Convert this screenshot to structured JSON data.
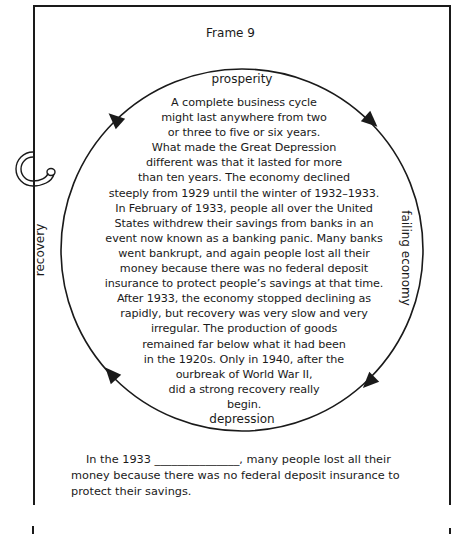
{
  "frame": {
    "title": "Frame 9"
  },
  "cycle": {
    "labels": {
      "top": "prosperity",
      "right": "failing economy",
      "bottom": "depression",
      "left": "recovery"
    },
    "arrow_direction": "clockwise",
    "passage_lines": [
      "A complete business cycle",
      "might last anywhere from two",
      "or three to five or six years.",
      "What made the Great Depression",
      "different was that it lasted for more",
      "than ten years. The economy declined",
      "steeply from 1929 until the winter of 1932–1933.",
      "In February of 1933, people all over the United",
      "States withdrew their savings from banks in an",
      "event now known as a banking panic. Many banks",
      "went bankrupt, and again people lost all their",
      "money because there was no federal deposit",
      "insurance to protect people’s savings at that time.",
      "After 1933, the economy stopped declining as",
      "rapidly, but recovery was very slow and very",
      "irregular. The production of goods",
      "remained far below what it had been",
      "in the 1920s. Only in 1940, after the",
      "ourbreak of World War II,",
      "did a strong recovery really",
      "begin."
    ]
  },
  "question": {
    "before_blank": "In the 1933 ",
    "blank": "_______________",
    "after_blank": ", many people lost all their money because there was no federal deposit insurance to protect their savings."
  },
  "colors": {
    "ink": "#1a1a1a",
    "paper": "#ffffff"
  }
}
